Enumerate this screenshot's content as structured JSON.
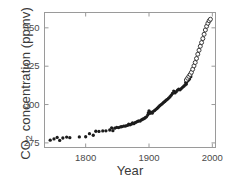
{
  "chart_data": {
    "type": "scatter",
    "title": "",
    "xlabel": "Year",
    "ylabel": "CO2 concentration (ppmv)",
    "ylabel_prefix": "CO",
    "ylabel_sub": "2",
    "ylabel_suffix": " concentration (ppmv)",
    "xlim": [
      1735,
      2005
    ],
    "ylim": [
      272,
      360
    ],
    "xticks": [
      1800,
      1900,
      2000
    ],
    "xtick_labels": [
      "1800",
      "1900",
      "2000"
    ],
    "yticks": [
      275,
      300,
      325,
      350
    ],
    "ytick_labels": [
      "275",
      "300",
      "325",
      "350"
    ],
    "grid": false,
    "legend": "none",
    "frame": true,
    "marker_color": "#1c1c1c",
    "axis_color": "#9a9a9a",
    "text_color": "#3a3a3a",
    "series": [
      {
        "name": "ice-core record",
        "marker": "filled-circle",
        "points": [
          [
            1744,
            276.8
          ],
          [
            1750,
            277.6
          ],
          [
            1755,
            278.6
          ],
          [
            1759,
            276.6
          ],
          [
            1764,
            278.2
          ],
          [
            1770,
            278.8
          ],
          [
            1775,
            278.4
          ],
          [
            1790,
            278.9
          ],
          [
            1800,
            279.0
          ],
          [
            1806,
            281.0
          ],
          [
            1812,
            280.0
          ],
          [
            1816,
            282.6
          ],
          [
            1821,
            282.5
          ],
          [
            1827,
            282.8
          ],
          [
            1832,
            282.9
          ],
          [
            1838,
            283.4
          ],
          [
            1841,
            284.8
          ],
          [
            1843,
            283.0
          ],
          [
            1846,
            284.6
          ],
          [
            1849,
            285.1
          ],
          [
            1852,
            285.0
          ],
          [
            1855,
            285.4
          ],
          [
            1857,
            285.6
          ],
          [
            1860,
            285.9
          ],
          [
            1863,
            286.0
          ],
          [
            1866,
            286.4
          ],
          [
            1868,
            287.3
          ],
          [
            1870,
            286.8
          ],
          [
            1872,
            287.2
          ],
          [
            1874,
            288.0
          ],
          [
            1876,
            287.5
          ],
          [
            1878,
            288.2
          ],
          [
            1880,
            288.6
          ],
          [
            1882,
            289.0
          ],
          [
            1884,
            289.4
          ],
          [
            1886,
            289.2
          ],
          [
            1888,
            290.0
          ],
          [
            1890,
            290.4
          ],
          [
            1892,
            290.8
          ],
          [
            1894,
            291.4
          ],
          [
            1896,
            292.0
          ],
          [
            1898,
            293.2
          ],
          [
            1899,
            294.6
          ],
          [
            1900,
            295.8
          ],
          [
            1901,
            294.2
          ],
          [
            1903,
            295.0
          ],
          [
            1905,
            294.4
          ],
          [
            1907,
            295.6
          ],
          [
            1909,
            296.2
          ],
          [
            1911,
            296.9
          ],
          [
            1913,
            297.6
          ],
          [
            1915,
            298.4
          ],
          [
            1917,
            299.2
          ],
          [
            1919,
            299.9
          ],
          [
            1921,
            300.6
          ],
          [
            1923,
            301.4
          ],
          [
            1925,
            302.0
          ],
          [
            1927,
            302.8
          ],
          [
            1929,
            303.4
          ],
          [
            1931,
            304.2
          ],
          [
            1933,
            305.0
          ],
          [
            1935,
            306.0
          ],
          [
            1937,
            307.2
          ],
          [
            1939,
            308.8
          ],
          [
            1941,
            307.6
          ],
          [
            1943,
            308.4
          ],
          [
            1945,
            309.4
          ],
          [
            1947,
            310.0
          ],
          [
            1949,
            309.6
          ],
          [
            1951,
            310.4
          ],
          [
            1953,
            311.2
          ],
          [
            1955,
            312.0
          ],
          [
            1957,
            312.8
          ],
          [
            1958,
            314.4
          ],
          [
            1959,
            313.4
          ],
          [
            1960,
            315.0
          ],
          [
            1962,
            315.8
          ],
          [
            1964,
            316.6
          ],
          [
            1966,
            318.2
          ]
        ]
      },
      {
        "name": "direct atmospheric measurements",
        "marker": "open-circle",
        "points": [
          [
            1959,
            316.0
          ],
          [
            1961,
            317.2
          ],
          [
            1963,
            318.4
          ],
          [
            1965,
            319.6
          ],
          [
            1967,
            321.0
          ],
          [
            1969,
            323.0
          ],
          [
            1971,
            325.2
          ],
          [
            1973,
            327.4
          ],
          [
            1975,
            330.0
          ],
          [
            1977,
            332.8
          ],
          [
            1979,
            335.4
          ],
          [
            1981,
            338.0
          ],
          [
            1983,
            340.4
          ],
          [
            1985,
            343.0
          ],
          [
            1987,
            345.8
          ],
          [
            1989,
            348.6
          ],
          [
            1991,
            351.0
          ],
          [
            1993,
            353.0
          ],
          [
            1995,
            354.6
          ],
          [
            1997,
            355.6
          ]
        ]
      }
    ]
  }
}
